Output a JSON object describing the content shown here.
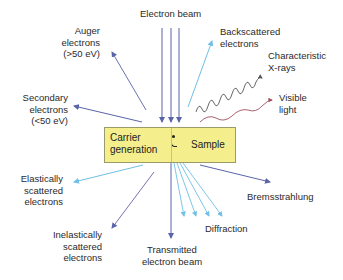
{
  "diagram": {
    "sample_box": {
      "left_label_line1": "Carrier",
      "left_label_line2": "generation",
      "right_label": "Sample",
      "fill_color": "#f4ef8c"
    },
    "labels": {
      "electron_beam": "Electron beam",
      "auger_1": "Auger",
      "auger_2": "electrons",
      "auger_3": "(>50 eV)",
      "secondary_1": "Secondary",
      "secondary_2": "electrons",
      "secondary_3": "(<50 eV)",
      "backscattered_1": "Backscattered",
      "backscattered_2": "electrons",
      "xrays_1": "Characteristic",
      "xrays_2": "X-rays",
      "visible_1": "Visible",
      "visible_2": "light",
      "elastic_1": "Elastically",
      "elastic_2": "scattered",
      "elastic_3": "electrons",
      "inelastic_1": "Inelastically",
      "inelastic_2": "scattered",
      "inelastic_3": "electrons",
      "transmitted_1": "Transmitted",
      "transmitted_2": "electron beam",
      "diffraction": "Diffraction",
      "bremsstrahlung": "Bremsstrahlung"
    },
    "colors": {
      "dark_arrow": "#5a64a8",
      "light_arrow": "#6ec0e6",
      "xray_wave": "#555555",
      "light_wave": "#a05060"
    }
  }
}
